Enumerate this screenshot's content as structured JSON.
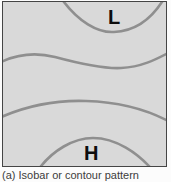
{
  "figure": {
    "caption": "(a) Isobar or contour pattern",
    "labels": {
      "low_pressure": "L",
      "high_pressure": "H"
    },
    "colors": {
      "panel_background": "#d9d9d9",
      "isobar_line": "#8f8f8f",
      "panel_border": "#454545",
      "label_text": "#0d0d0d",
      "caption_text": "#3c3c3c"
    }
  }
}
